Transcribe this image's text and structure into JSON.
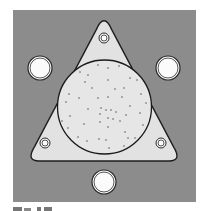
{
  "figure": {
    "colors": {
      "background": "#ffffff",
      "square_fill": "#8c8c8c",
      "plate_fill": "#e2e2e2",
      "plate_stroke": "#1e1e1e",
      "circle_fill": "#e6e6e6",
      "circle_stroke": "#1a1a1a",
      "dot_fill": "#9a9a9a",
      "hole_fill": "#fbfbfb",
      "hole_stroke": "#2a2a2a"
    },
    "square": {
      "x": 13,
      "y": 10,
      "width": 183,
      "height": 192
    },
    "plate": {
      "shape": "rounded-triangle",
      "apex": [
        104,
        15
      ],
      "bottom_left": [
        27,
        161
      ],
      "bottom_right": [
        181,
        161
      ]
    },
    "center_circle": {
      "cx": 104.5,
      "cy": 107,
      "r": 47
    },
    "small_holes": [
      {
        "name": "top",
        "cx": 104,
        "cy": 38,
        "r": 5
      },
      {
        "name": "bottom-left",
        "cx": 45,
        "cy": 143,
        "r": 5
      },
      {
        "name": "bottom-right",
        "cx": 161,
        "cy": 143,
        "r": 5
      }
    ],
    "large_holes": [
      {
        "name": "left",
        "cx": 40,
        "cy": 68,
        "r": 12
      },
      {
        "name": "right",
        "cx": 168,
        "cy": 68,
        "r": 12
      },
      {
        "name": "bottom",
        "cx": 104,
        "cy": 182,
        "r": 12
      }
    ],
    "dots": [
      [
        98,
        65
      ],
      [
        108,
        68
      ],
      [
        119,
        66
      ],
      [
        80,
        72
      ],
      [
        88,
        75
      ],
      [
        130,
        78
      ],
      [
        137,
        80
      ],
      [
        85,
        82
      ],
      [
        108,
        80
      ],
      [
        92,
        88
      ],
      [
        115,
        89
      ],
      [
        124,
        88
      ],
      [
        69,
        94
      ],
      [
        79,
        98
      ],
      [
        98,
        98
      ],
      [
        108,
        97
      ],
      [
        122,
        97
      ],
      [
        141,
        94
      ],
      [
        66,
        102
      ],
      [
        130,
        106
      ],
      [
        146,
        103
      ],
      [
        88,
        109
      ],
      [
        101,
        108
      ],
      [
        106,
        110
      ],
      [
        111,
        110
      ],
      [
        116,
        112
      ],
      [
        126,
        115
      ],
      [
        70,
        116
      ],
      [
        62,
        121
      ],
      [
        100,
        114
      ],
      [
        108,
        118
      ],
      [
        113,
        119
      ],
      [
        120,
        121
      ],
      [
        140,
        113
      ],
      [
        84,
        124
      ],
      [
        100,
        122
      ],
      [
        108,
        127
      ],
      [
        143,
        125
      ],
      [
        68,
        128
      ],
      [
        125,
        132
      ],
      [
        78,
        137
      ],
      [
        87,
        141
      ],
      [
        99,
        139
      ],
      [
        106,
        140
      ],
      [
        128,
        138
      ],
      [
        135,
        138
      ],
      [
        124,
        146
      ],
      [
        109,
        148
      ]
    ]
  },
  "caption": {
    "text": "",
    "truncated": true
  }
}
